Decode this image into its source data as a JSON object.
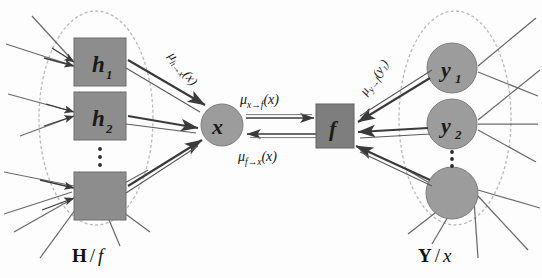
{
  "figure": {
    "type": "factor-graph-message-passing-diagram",
    "background_color": "#fdfdfd"
  },
  "colors": {
    "box_fill": "#8d8d8d",
    "box_stroke": "#6e6e6e",
    "factor_fill": "#7e7e7e",
    "circle_fill": "#9c9c9c",
    "circle_stroke": "#7d7d7d",
    "ellipse_stroke": "#b9b9b9",
    "thin_edge": "#6a6a6a",
    "arrow": "#3a3a3a",
    "text": "#141414"
  },
  "left_group": {
    "group_label_bold": "H",
    "group_label_slash": "/",
    "group_label_italic": "f",
    "nodes": [
      {
        "id": "h1",
        "label": "h",
        "subscript": "1",
        "shape": "square"
      },
      {
        "id": "h2",
        "label": "h",
        "subscript": "2",
        "shape": "square"
      },
      {
        "id": "hn",
        "label": "",
        "subscript": "",
        "shape": "square"
      }
    ],
    "ellipsis": "⋮"
  },
  "right_group": {
    "group_label_bold": "Y",
    "group_label_slash": "/",
    "group_label_italic": "x",
    "nodes": [
      {
        "id": "y1",
        "label": "y",
        "subscript": "1",
        "shape": "circle"
      },
      {
        "id": "y2",
        "label": "y",
        "subscript": "2",
        "shape": "circle"
      },
      {
        "id": "yn",
        "label": "",
        "subscript": "",
        "shape": "circle"
      }
    ],
    "ellipsis": "⋮"
  },
  "center": {
    "variable_node": {
      "id": "x",
      "label": "x",
      "shape": "circle"
    },
    "factor_node": {
      "id": "f",
      "label": "f",
      "shape": "square"
    }
  },
  "messages": {
    "h_to_x": {
      "mu": "μ",
      "subscript": "h→x",
      "argument": "(x)",
      "direction": "h-to-x",
      "rotated": true
    },
    "x_to_f": {
      "mu": "μ",
      "subscript": "x→f",
      "argument": "(x)",
      "direction": "left-to-right"
    },
    "f_to_x": {
      "mu": "μ",
      "subscript": "f→x",
      "argument": "(x)",
      "direction": "right-to-left"
    },
    "y_to_f": {
      "mu": "μ",
      "subscript": "y→f",
      "argument": "(y₁)",
      "direction": "y-to-f",
      "rotated": true
    }
  }
}
